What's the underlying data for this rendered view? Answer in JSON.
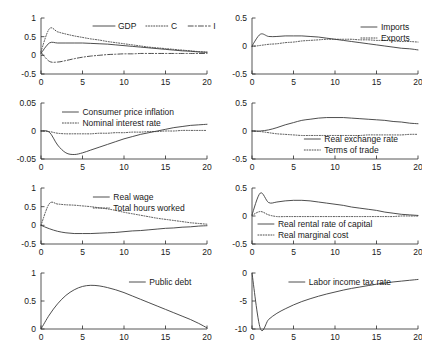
{
  "figure": {
    "type": "impulse-response-grid",
    "rows": 4,
    "cols": 2,
    "background": "#ffffff",
    "line_color": "#3a3a3a",
    "axis_color": "#2b2b2b"
  },
  "chart_data": [
    {
      "id": "panel-gdp-c-i",
      "position": {
        "row": 1,
        "col": 1
      },
      "type": "line",
      "title": "",
      "xlabel": "",
      "ylabel": "",
      "xlim": [
        0,
        20
      ],
      "ylim": [
        -0.5,
        1
      ],
      "xticks": [
        0,
        5,
        10,
        15,
        20
      ],
      "xticklabels": [
        "0",
        "5",
        "10",
        "15",
        "20"
      ],
      "yticks": [
        -0.5,
        0,
        0.5,
        1
      ],
      "yticklabels": [
        "-0.5",
        "0",
        "0.5",
        "1"
      ],
      "grid": false,
      "legend_position": "top-right",
      "x": [
        0,
        1,
        2,
        3,
        4,
        5,
        6,
        7,
        8,
        9,
        10,
        11,
        12,
        13,
        14,
        15,
        16,
        17,
        18,
        19,
        20
      ],
      "series": [
        {
          "name": "GDP",
          "style": "solid",
          "values": [
            0.05,
            0.33,
            0.33,
            0.33,
            0.33,
            0.33,
            0.32,
            0.31,
            0.3,
            0.28,
            0.26,
            0.24,
            0.22,
            0.2,
            0.18,
            0.16,
            0.14,
            0.12,
            0.11,
            0.09,
            0.08
          ]
        },
        {
          "name": "C",
          "style": "dotted",
          "values": [
            0.1,
            0.71,
            0.63,
            0.57,
            0.52,
            0.48,
            0.44,
            0.41,
            0.37,
            0.34,
            0.31,
            0.28,
            0.25,
            0.22,
            0.2,
            0.18,
            0.16,
            0.14,
            0.12,
            0.1,
            0.09
          ]
        },
        {
          "name": "I",
          "style": "dashdot",
          "values": [
            0.08,
            -0.16,
            -0.18,
            -0.14,
            -0.09,
            -0.05,
            -0.02,
            0.0,
            0.02,
            0.03,
            0.04,
            0.04,
            0.05,
            0.05,
            0.05,
            0.05,
            0.05,
            0.05,
            0.05,
            0.05,
            0.05
          ]
        }
      ]
    },
    {
      "id": "panel-imports-exports",
      "position": {
        "row": 1,
        "col": 2
      },
      "type": "line",
      "xlim": [
        0,
        20
      ],
      "ylim": [
        -0.5,
        0.5
      ],
      "xticks": [
        0,
        5,
        10,
        15,
        20
      ],
      "xticklabels": [
        "0",
        "5",
        "10",
        "15",
        "20"
      ],
      "yticks": [
        -0.5,
        0,
        0.5
      ],
      "yticklabels": [
        "-0.5",
        "0",
        "0.5"
      ],
      "grid": false,
      "legend_position": "top-right",
      "x": [
        0,
        1,
        2,
        3,
        4,
        5,
        6,
        7,
        8,
        9,
        10,
        11,
        12,
        13,
        14,
        15,
        16,
        17,
        18,
        19,
        20
      ],
      "series": [
        {
          "name": "Imports",
          "style": "solid",
          "values": [
            0.0,
            0.21,
            0.17,
            0.17,
            0.18,
            0.18,
            0.18,
            0.17,
            0.16,
            0.14,
            0.12,
            0.1,
            0.08,
            0.06,
            0.04,
            0.02,
            0.0,
            -0.02,
            -0.04,
            -0.05,
            -0.07
          ]
        },
        {
          "name": "Exports",
          "style": "dotted",
          "values": [
            -0.01,
            0.01,
            0.03,
            0.04,
            0.06,
            0.07,
            0.09,
            0.1,
            0.11,
            0.12,
            0.12,
            0.12,
            0.12,
            0.11,
            0.11,
            0.1,
            0.1,
            0.09,
            0.08,
            0.08,
            0.07
          ]
        }
      ]
    },
    {
      "id": "panel-inflation-nominal-rate",
      "position": {
        "row": 2,
        "col": 1
      },
      "type": "line",
      "xlim": [
        0,
        20
      ],
      "ylim": [
        -0.05,
        0.05
      ],
      "xticks": [
        0,
        5,
        10,
        15,
        20
      ],
      "xticklabels": [
        "0",
        "5",
        "10",
        "15",
        "20"
      ],
      "yticks": [
        -0.05,
        0,
        0.05
      ],
      "yticklabels": [
        "-0.05",
        "0",
        "0.05"
      ],
      "grid": false,
      "legend_position": "top-right",
      "x": [
        0,
        1,
        2,
        3,
        4,
        5,
        6,
        7,
        8,
        9,
        10,
        11,
        12,
        13,
        14,
        15,
        16,
        17,
        18,
        19,
        20
      ],
      "series": [
        {
          "name": "Consumer price inflation",
          "style": "solid",
          "values": [
            0.0,
            -0.002,
            -0.025,
            -0.039,
            -0.042,
            -0.039,
            -0.034,
            -0.029,
            -0.024,
            -0.019,
            -0.014,
            -0.01,
            -0.006,
            -0.003,
            0.0,
            0.003,
            0.006,
            0.008,
            0.01,
            0.011,
            0.012
          ]
        },
        {
          "name": "Nominal interest rate",
          "style": "dotted",
          "values": [
            0.0,
            -0.001,
            -0.004,
            -0.005,
            -0.005,
            -0.005,
            -0.005,
            -0.004,
            -0.004,
            -0.003,
            -0.003,
            -0.002,
            -0.002,
            -0.001,
            -0.001,
            0.0,
            0.0,
            0.001,
            0.001,
            0.001,
            0.001
          ]
        }
      ]
    },
    {
      "id": "panel-real-exchange-terms-of-trade",
      "position": {
        "row": 2,
        "col": 2
      },
      "type": "line",
      "xlim": [
        0,
        20
      ],
      "ylim": [
        -0.5,
        0.5
      ],
      "xticks": [
        0,
        5,
        10,
        15,
        20
      ],
      "xticklabels": [
        "0",
        "5",
        "10",
        "15",
        "20"
      ],
      "yticks": [
        -0.5,
        0,
        0.5
      ],
      "yticklabels": [
        "-0.5",
        "0",
        "0.5"
      ],
      "grid": false,
      "legend_position": "bottom-right",
      "x": [
        0,
        1,
        2,
        3,
        4,
        5,
        6,
        7,
        8,
        9,
        10,
        11,
        12,
        13,
        14,
        15,
        16,
        17,
        18,
        19,
        20
      ],
      "series": [
        {
          "name": "Real exchange rate",
          "style": "solid",
          "values": [
            0.0,
            0.0,
            0.02,
            0.06,
            0.11,
            0.15,
            0.19,
            0.21,
            0.23,
            0.24,
            0.24,
            0.24,
            0.23,
            0.22,
            0.21,
            0.2,
            0.19,
            0.17,
            0.16,
            0.14,
            0.13
          ]
        },
        {
          "name": "Terms of trade",
          "style": "dotted",
          "values": [
            0.0,
            -0.01,
            -0.03,
            -0.05,
            -0.06,
            -0.07,
            -0.08,
            -0.08,
            -0.08,
            -0.08,
            -0.08,
            -0.08,
            -0.08,
            -0.08,
            -0.07,
            -0.07,
            -0.07,
            -0.07,
            -0.07,
            -0.06,
            -0.06
          ]
        }
      ]
    },
    {
      "id": "panel-real-wage-hours",
      "position": {
        "row": 3,
        "col": 1
      },
      "type": "line",
      "xlim": [
        0,
        20
      ],
      "ylim": [
        -0.5,
        1
      ],
      "xticks": [
        0,
        5,
        10,
        15,
        20
      ],
      "xticklabels": [
        "0",
        "5",
        "10",
        "15",
        "20"
      ],
      "yticks": [
        -0.5,
        0,
        0.5,
        1
      ],
      "yticklabels": [
        "-0.5",
        "0",
        "0.5",
        "1"
      ],
      "grid": false,
      "legend_position": "top-right",
      "x": [
        0,
        1,
        2,
        3,
        4,
        5,
        6,
        7,
        8,
        9,
        10,
        11,
        12,
        13,
        14,
        15,
        16,
        17,
        18,
        19,
        20
      ],
      "series": [
        {
          "name": "Real wage",
          "style": "solid",
          "values": [
            0.0,
            -0.09,
            -0.16,
            -0.2,
            -0.22,
            -0.22,
            -0.22,
            -0.21,
            -0.2,
            -0.19,
            -0.17,
            -0.15,
            -0.14,
            -0.12,
            -0.1,
            -0.08,
            -0.07,
            -0.05,
            -0.04,
            -0.02,
            -0.01
          ]
        },
        {
          "name": "Total hours worked",
          "style": "dotted",
          "values": [
            0.0,
            0.58,
            0.57,
            0.55,
            0.54,
            0.52,
            0.5,
            0.47,
            0.44,
            0.4,
            0.35,
            0.31,
            0.27,
            0.23,
            0.19,
            0.16,
            0.13,
            0.1,
            0.07,
            0.05,
            0.03
          ]
        }
      ]
    },
    {
      "id": "panel-rental-rate-marginal-cost",
      "position": {
        "row": 3,
        "col": 2
      },
      "type": "line",
      "xlim": [
        0,
        20
      ],
      "ylim": [
        -0.5,
        0.5
      ],
      "xticks": [
        0,
        5,
        10,
        15,
        20
      ],
      "xticklabels": [
        "0",
        "5",
        "10",
        "15",
        "20"
      ],
      "yticks": [
        -0.5,
        0,
        0.5
      ],
      "yticklabels": [
        "-0.5",
        "0",
        "0.5"
      ],
      "grid": false,
      "legend_position": "bottom-right",
      "x": [
        0,
        1,
        2,
        3,
        4,
        5,
        6,
        7,
        8,
        9,
        10,
        11,
        12,
        13,
        14,
        15,
        16,
        17,
        18,
        19,
        20
      ],
      "series": [
        {
          "name": "Real rental rate of capital",
          "style": "solid",
          "values": [
            0.02,
            0.41,
            0.24,
            0.25,
            0.27,
            0.28,
            0.28,
            0.27,
            0.25,
            0.23,
            0.21,
            0.19,
            0.16,
            0.14,
            0.12,
            0.1,
            0.07,
            0.05,
            0.03,
            0.02,
            0.01
          ]
        },
        {
          "name": "Real marginal cost",
          "style": "dotted",
          "values": [
            0.01,
            0.08,
            0.02,
            -0.01,
            -0.01,
            -0.01,
            -0.01,
            -0.01,
            -0.01,
            -0.01,
            -0.01,
            -0.01,
            -0.01,
            -0.01,
            -0.01,
            -0.01,
            -0.01,
            -0.01,
            0.0,
            0.0,
            0.0
          ]
        }
      ]
    },
    {
      "id": "panel-public-debt",
      "position": {
        "row": 4,
        "col": 1
      },
      "type": "line",
      "xlim": [
        0,
        20
      ],
      "ylim": [
        0,
        1
      ],
      "xticks": [
        0,
        5,
        10,
        15,
        20
      ],
      "xticklabels": [
        "0",
        "5",
        "10",
        "15",
        "20"
      ],
      "yticks": [
        0,
        0.5,
        1
      ],
      "yticklabels": [
        "0",
        "0.5",
        "1"
      ],
      "grid": false,
      "legend_position": "top-right",
      "x": [
        0,
        1,
        2,
        3,
        4,
        5,
        6,
        7,
        8,
        9,
        10,
        11,
        12,
        13,
        14,
        15,
        16,
        17,
        18,
        19,
        20
      ],
      "series": [
        {
          "name": "Public debt",
          "style": "solid",
          "values": [
            0.0,
            0.25,
            0.45,
            0.6,
            0.7,
            0.76,
            0.78,
            0.77,
            0.74,
            0.7,
            0.65,
            0.59,
            0.53,
            0.47,
            0.41,
            0.35,
            0.29,
            0.23,
            0.17,
            0.1,
            0.02
          ]
        }
      ]
    },
    {
      "id": "panel-labor-income-tax-rate",
      "position": {
        "row": 4,
        "col": 2
      },
      "type": "line",
      "xlim": [
        0,
        20
      ],
      "ylim": [
        -10,
        0
      ],
      "xticks": [
        0,
        5,
        10,
        15,
        20
      ],
      "xticklabels": [
        "0",
        "5",
        "10",
        "15",
        "20"
      ],
      "yticks": [
        -10,
        -5,
        0
      ],
      "yticklabels": [
        "-10",
        "-5",
        "0"
      ],
      "grid": false,
      "legend_position": "top-right",
      "x": [
        0,
        1,
        2,
        3,
        4,
        5,
        6,
        7,
        8,
        9,
        10,
        11,
        12,
        13,
        14,
        15,
        16,
        17,
        18,
        19,
        20
      ],
      "series": [
        {
          "name": "Labor income tax rate",
          "style": "solid",
          "values": [
            0.0,
            -9.9,
            -8.3,
            -7.2,
            -6.4,
            -5.7,
            -5.1,
            -4.6,
            -4.15,
            -3.75,
            -3.4,
            -3.05,
            -2.75,
            -2.5,
            -2.25,
            -2.0,
            -1.8,
            -1.6,
            -1.45,
            -1.3,
            -1.15
          ]
        }
      ]
    }
  ]
}
